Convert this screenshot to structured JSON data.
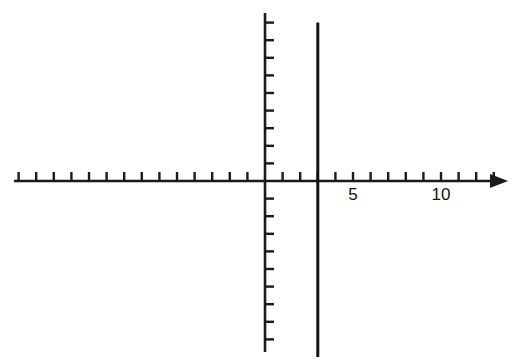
{
  "figure": {
    "title": "",
    "background_color": "#ffffff",
    "width": 513,
    "height": 363,
    "axis_color": "#1a1a1a",
    "curve_color": "#111111"
  },
  "axes": {
    "x_axis_name": "x-axis",
    "y_axis_name": "y-axis",
    "origin_px": {
      "x": 265,
      "y": 181
    },
    "unit_px": 17.6,
    "x_axis_start_px": 14,
    "x_axis_end_px": 508,
    "y_axis_top_px": 13,
    "y_axis_bottom_px": 352,
    "x_arrow": "right",
    "y_arrow": "none",
    "tick_length_px": 9,
    "x_tick_values": [
      -14,
      -13,
      -12,
      -11,
      -10,
      -9,
      -8,
      -7,
      -6,
      -5,
      -4,
      -3,
      -2,
      -1,
      1,
      2,
      3,
      4,
      5,
      6,
      7,
      8,
      9,
      10,
      11,
      12,
      13
    ],
    "y_tick_values": [
      -9,
      -8,
      -7,
      -6,
      -5,
      -4,
      -3,
      -2,
      -1,
      1,
      2,
      3,
      4,
      5,
      6,
      7,
      8,
      9
    ],
    "x_tick_labels": [
      {
        "value": 5,
        "text": "5"
      },
      {
        "value": 10,
        "text": "10"
      }
    ],
    "y_tick_labels": []
  },
  "chart_data": {
    "type": "line",
    "title": "",
    "xlabel": "",
    "ylabel": "",
    "xlim": [
      -14.2,
      13.8
    ],
    "ylim": [
      -10,
      9.5
    ],
    "grid": false,
    "legend": "none",
    "x_tick_labels": [
      "5",
      "10"
    ],
    "x_tick_label_values": [
      5,
      10
    ],
    "y_tick_labels": [],
    "series": [
      {
        "name": "vertical-line-x-equals-3",
        "equation": "x = 3",
        "type": "vertical-line",
        "x": 3,
        "y_from": 9.0,
        "y_to": -10.0,
        "color": "#111111",
        "line_width_px": 3,
        "points": [
          {
            "x": 3,
            "y": 9.0
          },
          {
            "x": 3,
            "y": -10.0
          }
        ]
      }
    ],
    "annotations": []
  }
}
